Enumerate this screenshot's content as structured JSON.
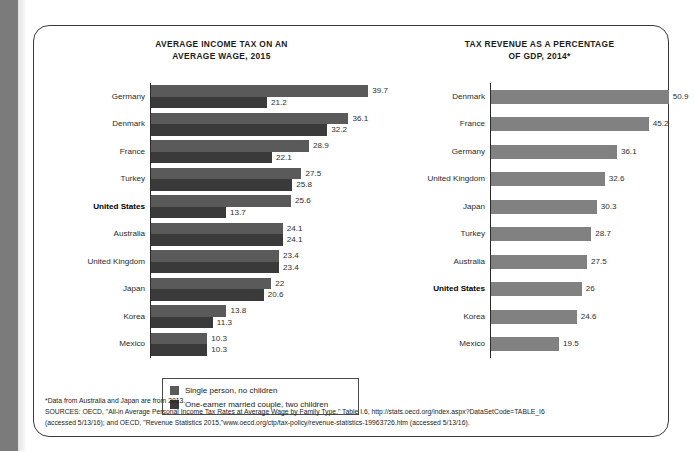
{
  "colors": {
    "series1": "#5a5a5a",
    "series2": "#3a3a3a",
    "single_series": "#818181",
    "axis": "#2b2b2b",
    "border": "#3a3a3a",
    "page_edge": "#7b7b7b"
  },
  "legend": {
    "items": [
      {
        "label": "Single person, no children",
        "color": "#5a5a5a"
      },
      {
        "label": "One-earner married couple, two children",
        "color": "#3a3a3a"
      }
    ]
  },
  "footnotes": [
    "*Data from Australia and Japan are from 2013.",
    "SOURCES: OECD, \"All-in Average Personal Income Tax Rates at Average Wage by Family Type,\" Table I.6, http://stats.oecd.org/index.aspx?DataSetCode=TABLE_I6",
    "(accessed 5/13/16); and OECD, \"Revenue Statistics 2015,\"www.oecd.org/ctp/tax-policy/revenue-statistics-19963726.htm (accessed 5/13/16)."
  ],
  "chart_data": [
    {
      "type": "bar",
      "orientation": "horizontal",
      "title": "AVERAGE INCOME TAX ON AN AVERAGE WAGE, 2015",
      "title_line1": "AVERAGE INCOME TAX ON AN",
      "title_line2": "AVERAGE WAGE, 2015",
      "xlabel": "",
      "ylabel": "",
      "xlim": [
        0,
        45
      ],
      "grid": false,
      "legend_position": "below-chart",
      "highlight_category": "United States",
      "categories": [
        "Germany",
        "Denmark",
        "France",
        "Turkey",
        "United States",
        "Australia",
        "United Kingdom",
        "Japan",
        "Korea",
        "Mexico"
      ],
      "series": [
        {
          "name": "Single person, no children",
          "color": "#5a5a5a",
          "values": [
            39.7,
            36.1,
            28.9,
            27.5,
            25.6,
            24.1,
            23.4,
            22,
            13.8,
            10.3
          ],
          "labels": [
            "39.7",
            "36.1",
            "28.9",
            "27.5",
            "25.6",
            "24.1",
            "23.4",
            "22",
            "13.8",
            "10.3"
          ]
        },
        {
          "name": "One-earner married couple, two children",
          "color": "#3a3a3a",
          "values": [
            21.2,
            32.2,
            22.1,
            25.8,
            13.7,
            24.1,
            23.4,
            20.6,
            11.3,
            10.3
          ],
          "labels": [
            "21.2",
            "32.2",
            "22.1",
            "25.8",
            "13.7",
            "24.1",
            "23.4",
            "20.6",
            "11.3",
            "10.3"
          ]
        }
      ]
    },
    {
      "type": "bar",
      "orientation": "horizontal",
      "title": "TAX REVENUE AS A PERCENTAGE OF GDP, 2014*",
      "title_line1": "TAX REVENUE AS A PERCENTAGE",
      "title_line2": "OF GDP, 2014*",
      "xlabel": "",
      "ylabel": "",
      "xlim": [
        0,
        55
      ],
      "grid": false,
      "legend_position": "none",
      "highlight_category": "United States",
      "categories": [
        "Denmark",
        "France",
        "Germany",
        "United Kingdom",
        "Japan",
        "Turkey",
        "Australia",
        "United States",
        "Korea",
        "Mexico"
      ],
      "series": [
        {
          "name": "Tax revenue as a percentage of GDP",
          "color": "#818181",
          "values": [
            50.9,
            45.2,
            36.1,
            32.6,
            30.3,
            28.7,
            27.5,
            26,
            24.6,
            19.5
          ],
          "labels": [
            "50.9",
            "45.2",
            "36.1",
            "32.6",
            "30.3",
            "28.7",
            "27.5",
            "26",
            "24.6",
            "19.5"
          ]
        }
      ]
    }
  ]
}
